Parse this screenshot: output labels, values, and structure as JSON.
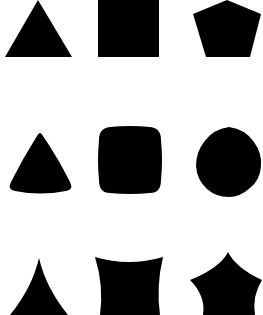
{
  "figure": {
    "background": "#ffffff",
    "fill": "#000000",
    "grid": {
      "rows": 3,
      "cols": 3,
      "rows_description": [
        "straight-edged polygons",
        "rounded / convex-bulged polygons",
        "concave-edged polygons"
      ],
      "cols_description": [
        "triangle",
        "square",
        "pentagon"
      ]
    },
    "shapes": [
      {
        "row": 0,
        "col": 0,
        "name": "triangle"
      },
      {
        "row": 0,
        "col": 1,
        "name": "square"
      },
      {
        "row": 0,
        "col": 2,
        "name": "pentagon"
      },
      {
        "row": 1,
        "col": 0,
        "name": "rounded-triangle"
      },
      {
        "row": 1,
        "col": 1,
        "name": "rounded-square"
      },
      {
        "row": 1,
        "col": 2,
        "name": "rounded-pentagon"
      },
      {
        "row": 2,
        "col": 0,
        "name": "concave-triangle"
      },
      {
        "row": 2,
        "col": 1,
        "name": "concave-square"
      },
      {
        "row": 2,
        "col": 2,
        "name": "concave-pentagon"
      }
    ]
  }
}
